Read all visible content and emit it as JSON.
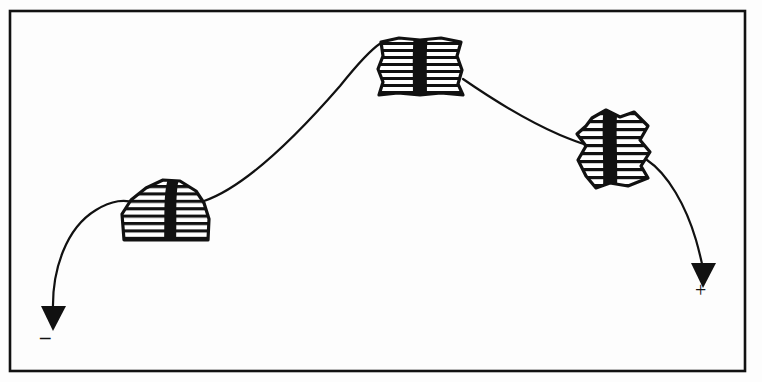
{
  "figure": {
    "background_color": "#fdfdfd",
    "ink_color": "#111111",
    "frame": {
      "name": "figure-border",
      "x": 10,
      "y": 11,
      "width": 735,
      "height": 360,
      "stroke_color": "#111111",
      "stroke_width": 2.6
    },
    "labels": {
      "minus_sign": "–",
      "plus_sign": "+"
    },
    "trajectory": {
      "stroke_color": "#111111",
      "stroke_width": 2.2,
      "description": "A single continuous curved path entering at the lower-left arrowhead, rising over the first mound, peaking at the second block, descending past the third block and ending at the lower-right arrowhead.",
      "segments": [
        {
          "name": "segment-left-entry",
          "path": "M 53,312 C 52,270 66,228 96,210 C 112,200 124,200 132,203"
        },
        {
          "name": "segment-mound1-to-block2",
          "path": "M 204,201 C 248,186 300,132 340,86 C 356,66 370,50 381,43"
        },
        {
          "name": "segment-block2-to-block3",
          "path": "M 463,79 C 492,99 530,122 560,135 C 572,140 580,143 586,145"
        },
        {
          "name": "segment-right-exit",
          "path": "M 647,160 C 668,174 686,206 696,240 C 700,254 702,264 703,270"
        }
      ]
    },
    "arrowheads": [
      {
        "name": "arrowhead-minus-end",
        "tip_x": 53,
        "tip_y": 331,
        "direction": "down",
        "polygon": "41,306 66,306 53,331"
      },
      {
        "name": "arrowhead-plus-end",
        "tip_x": 703,
        "tip_y": 288,
        "direction": "down",
        "polygon": "691,263 716,263 703,288"
      }
    ],
    "blobs": [
      {
        "name": "hatched-blob-1",
        "shape": "mound",
        "outline": "M 124,240 L 122,214 L 131,200 L 146,188 L 163,180 L 180,181 L 196,191 L 204,203 L 209,219 L 208,240 Z",
        "hatch_lines": 8,
        "bar": {
          "x": 163,
          "y_top": 181,
          "y_bottom": 240,
          "width": 11
        }
      },
      {
        "name": "hatched-blob-2",
        "shape": "barrel",
        "outline": "M 381,42 L 399,38 L 420,40 L 441,38 L 461,42 L 457,56 L 462,70 L 458,84 L 463,95 L 441,93 L 420,95 L 398,93 L 379,95 L 383,82 L 378,69 L 383,56 Z",
        "hatch_lines": 8,
        "bar": {
          "x": 419,
          "y_top": 38,
          "y_bottom": 95,
          "width": 11
        }
      },
      {
        "name": "hatched-blob-3",
        "shape": "angular",
        "outline": "M 592,118 L 606,110 L 620,117 L 634,112 L 648,126 L 640,140 L 650,152 L 641,166 L 648,178 L 628,186 L 610,183 L 596,188 L 586,176 L 578,160 L 586,146 L 577,134 L 586,126 Z",
        "hatch_lines": 9,
        "bar": {
          "x": 611,
          "y_top": 110,
          "y_bottom": 188,
          "width": 11
        }
      }
    ]
  }
}
